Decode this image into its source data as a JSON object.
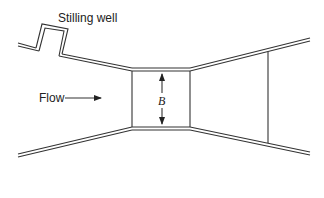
{
  "diagram": {
    "labels": {
      "stilling_well": "Stilling well",
      "flow": "Flow",
      "throat_width": "B"
    },
    "colors": {
      "line": "#333333",
      "background": "#ffffff"
    }
  }
}
